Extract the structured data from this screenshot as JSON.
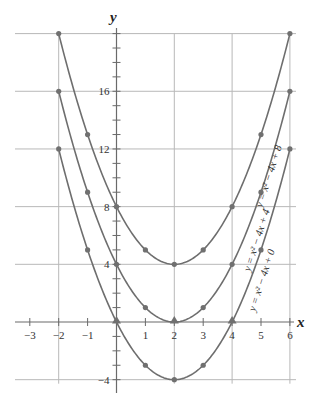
{
  "chart_data": {
    "type": "line",
    "title": "",
    "xlabel": "x",
    "ylabel": "y",
    "xlim": [
      -3.5,
      6.3
    ],
    "ylim": [
      -4.5,
      21
    ],
    "x_ticks": [
      -3,
      -2,
      -1,
      1,
      2,
      3,
      4,
      5,
      6
    ],
    "y_tick_labels": [
      16,
      12,
      8,
      4,
      -4
    ],
    "y_minor_tick_step": 1,
    "grid": true,
    "grid_x": [
      -2,
      2,
      4,
      6
    ],
    "grid_y": [
      20,
      16,
      12,
      8,
      4,
      -4
    ],
    "x": [
      -2,
      -1,
      0,
      1,
      2,
      3,
      4,
      5,
      6
    ],
    "series": [
      {
        "name": "y = x^2 - 4x + 8",
        "label": "y = x² − 4x + 8",
        "values": [
          20,
          13,
          8,
          5,
          4,
          5,
          8,
          13,
          20
        ]
      },
      {
        "name": "y = x^2 - 4x + 4",
        "label": "y = x² − 4x + 4",
        "values": [
          16,
          9,
          4,
          1,
          0,
          1,
          4,
          9,
          16
        ]
      },
      {
        "name": "y = x^2 - 4x + 0",
        "label": "y = x² − 4x + 0",
        "values": [
          12,
          5,
          0,
          -3,
          -4,
          -3,
          0,
          5,
          12
        ]
      }
    ],
    "x_intercepts": [
      {
        "x": 0,
        "y": 0
      },
      {
        "x": 2,
        "y": 0
      },
      {
        "x": 4,
        "y": 0
      }
    ]
  },
  "labels": {
    "x_axis": "x",
    "y_axis": "y",
    "curve1": "y = x² − 4x + 8",
    "curve2": "y = x² − 4x + 4",
    "curve3": "y = x² − 4x + 0"
  },
  "style": {
    "curve_color": "#6e6e6e",
    "grid_color": "#b8b8b8"
  }
}
